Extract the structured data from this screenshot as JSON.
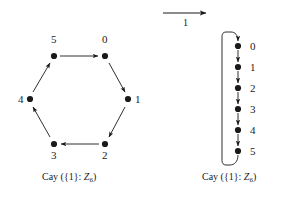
{
  "figure": {
    "background_color": "#ffffff",
    "ink_color": "#1a1a1a",
    "width": 302,
    "height": 200
  },
  "generator_arrow": {
    "label": "1",
    "name": "generator-arrow",
    "x1": 163,
    "y1": 13,
    "x2": 212,
    "y2": 13,
    "label_x": 185,
    "label_y": 17
  },
  "left_graph": {
    "caption_prefix": "Cay (",
    "caption_set": "{1}",
    "caption_sep": ": ",
    "caption_group": "Z",
    "caption_group_sub": "6",
    "caption_suffix": ")",
    "caption_full": "Cay ({1}: Z6)",
    "caption_x": 85,
    "caption_y": 176,
    "type": "hexagon-cycle",
    "nodes": [
      {
        "label": "0",
        "x": 105,
        "y": 56,
        "lx": 102,
        "ly": 38
      },
      {
        "label": "1",
        "x": 128,
        "y": 99,
        "lx": 136,
        "ly": 94
      },
      {
        "label": "2",
        "x": 105,
        "y": 144,
        "lx": 102,
        "ly": 152
      },
      {
        "label": "3",
        "x": 54,
        "y": 144,
        "lx": 51,
        "ly": 152
      },
      {
        "label": "4",
        "x": 30,
        "y": 99,
        "lx": 18,
        "ly": 94
      },
      {
        "label": "5",
        "x": 54,
        "y": 56,
        "lx": 51,
        "ly": 38
      }
    ],
    "edges": [
      {
        "from": "5",
        "to": "0"
      },
      {
        "from": "0",
        "to": "1"
      },
      {
        "from": "1",
        "to": "2"
      },
      {
        "from": "2",
        "to": "3"
      },
      {
        "from": "3",
        "to": "4"
      },
      {
        "from": "4",
        "to": "5"
      }
    ]
  },
  "right_graph": {
    "caption_prefix": "Cay (",
    "caption_set": "{1}",
    "caption_sep": ": ",
    "caption_group": "Z",
    "caption_group_sub": "6",
    "caption_suffix": ")",
    "caption_full": "Cay ({1}: Z6)",
    "caption_x": 245,
    "caption_y": 176,
    "type": "vertical-chain-with-wraparound",
    "node_x": 238,
    "label_x": 250,
    "nodes": [
      {
        "label": "0",
        "x": 238,
        "y": 46
      },
      {
        "label": "1",
        "x": 238,
        "y": 67
      },
      {
        "label": "2",
        "x": 238,
        "y": 88
      },
      {
        "label": "3",
        "x": 238,
        "y": 109
      },
      {
        "label": "4",
        "x": 238,
        "y": 130
      },
      {
        "label": "5",
        "x": 238,
        "y": 151
      }
    ],
    "edges": [
      {
        "from": "0",
        "to": "1"
      },
      {
        "from": "1",
        "to": "2"
      },
      {
        "from": "2",
        "to": "3"
      },
      {
        "from": "3",
        "to": "4"
      },
      {
        "from": "4",
        "to": "5"
      },
      {
        "from": "5",
        "to": "0",
        "style": "wraparound-left"
      }
    ],
    "wraparound": {
      "left_x": 222,
      "top_y": 32,
      "bottom_y": 165
    }
  }
}
